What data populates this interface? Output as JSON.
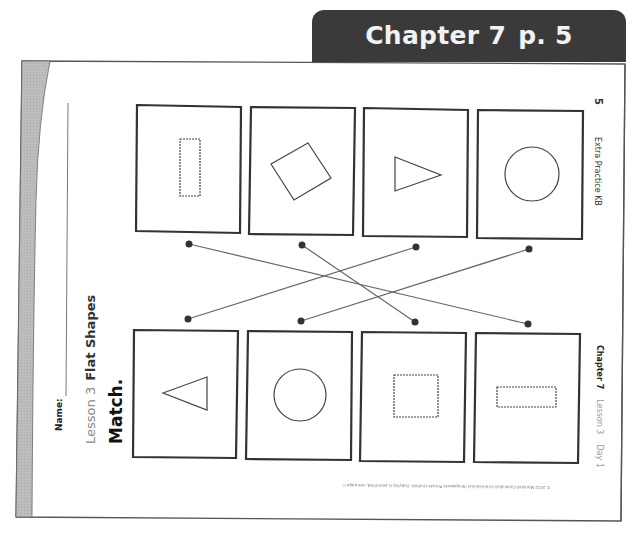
{
  "banner": {
    "chapter": "Chapter 7",
    "page": "p. 5",
    "bg_color": "#3a3a3a"
  },
  "worksheet": {
    "name_label": "Name:",
    "lesson_label": "Lesson 3",
    "lesson_title": "Flat Shapes",
    "instruction": "Match.",
    "page_number": "5",
    "book_title": "Extra Practice KB",
    "footer_chapter": "Chapter 7",
    "footer_lesson": "Lesson 3",
    "footer_day": "Day 1",
    "copyright": "© 2012 Marshall Cavendish International (Singapore) Private Limited. Copying is permitted; see page ii"
  },
  "top_row": [
    {
      "shape": "tall-rectangle",
      "style": "dashed"
    },
    {
      "shape": "tilted-square",
      "style": "solid"
    },
    {
      "shape": "triangle-right",
      "style": "solid"
    },
    {
      "shape": "circle",
      "style": "solid"
    }
  ],
  "bottom_row": [
    {
      "shape": "triangle-left",
      "style": "solid"
    },
    {
      "shape": "circle",
      "style": "solid"
    },
    {
      "shape": "square",
      "style": "dashed"
    },
    {
      "shape": "wide-rectangle",
      "style": "dashed"
    }
  ],
  "matches": [
    {
      "from_top": 1,
      "to_bottom": 4
    },
    {
      "from_top": 2,
      "to_bottom": 3
    },
    {
      "from_top": 3,
      "to_bottom": 1
    },
    {
      "from_top": 4,
      "to_bottom": 2
    }
  ]
}
